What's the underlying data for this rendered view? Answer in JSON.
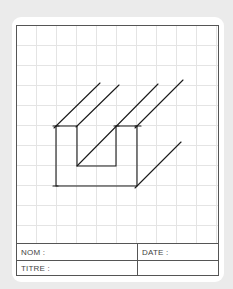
{
  "title_block": {
    "nom_label": "NOM :",
    "date_label": "DATE :",
    "titre_label": "TITRE :",
    "nom_value": "",
    "date_value": "",
    "titre_value": ""
  },
  "drawing": {
    "description": "Isometric sketch of a U-shaped channel extrusion on grid paper",
    "grid_spacing_px": 20,
    "stroke_color": "#1a1a1a"
  },
  "colors": {
    "page_background": "#ebebeb",
    "card_background": "#ffffff",
    "border": "#555555",
    "grid": "#e4e4e4"
  }
}
